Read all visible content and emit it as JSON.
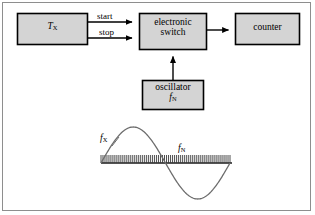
{
  "figure": {
    "type": "block-diagram",
    "caption": "",
    "background_color": "#ffffff",
    "border_color": "#8e8e8e",
    "box_fill_color": "#d4d4d4",
    "box_stroke_color": "#000000",
    "line_color": "#000000",
    "wave_color": "#6d6d6d"
  },
  "blocks": [
    {
      "id": "tx",
      "name": "tx-block",
      "label_main": "T",
      "label_sub": "X",
      "italic": true,
      "x": 17,
      "y": 13,
      "w": 71,
      "h": 32
    },
    {
      "id": "switch",
      "name": "electronic-switch-block",
      "label_line1": "electronic",
      "label_line2": "switch",
      "x": 139,
      "y": 13,
      "w": 68,
      "h": 37
    },
    {
      "id": "counter",
      "name": "counter-block",
      "label_line1": "counter",
      "x": 235,
      "y": 13,
      "w": 65,
      "h": 32
    },
    {
      "id": "oscillator",
      "name": "oscillator-block",
      "label_line1": "oscillator",
      "label_main": "f",
      "label_sub": "N",
      "x": 142,
      "y": 80,
      "w": 62,
      "h": 30
    }
  ],
  "edges": [
    {
      "id": "start",
      "name": "start-signal-edge",
      "label": "start",
      "from": "tx",
      "to": "switch",
      "y": 22
    },
    {
      "id": "stop",
      "name": "stop-signal-edge",
      "label": "stop",
      "from": "tx",
      "to": "switch",
      "y": 38
    },
    {
      "id": "gate-out",
      "name": "switch-to-counter-edge",
      "label": "",
      "from": "switch",
      "to": "counter",
      "y": 30
    },
    {
      "id": "clock",
      "name": "oscillator-to-switch-edge",
      "label": "",
      "from": "oscillator",
      "to": "switch",
      "x": 173
    }
  ],
  "waveform": {
    "name": "waveform-plot",
    "signal_label_main": "f",
    "signal_label_sub": "X",
    "pulse_label_main": "f",
    "pulse_label_sub": "N",
    "baseline_y": 163,
    "x_start": 101,
    "x_end": 230,
    "amplitude": 36,
    "cycles": 1,
    "pulse_count": 66,
    "pulse_height": 8
  },
  "chart_data": {
    "type": "line",
    "title": "",
    "xlabel": "",
    "ylabel": "",
    "series": [
      {
        "name": "f_X",
        "kind": "sine",
        "cycles": 1,
        "amplitude": 36,
        "phase": 0
      },
      {
        "name": "f_N",
        "kind": "pulse-train",
        "count": 66,
        "height": 8
      }
    ],
    "x": [
      101,
      230
    ],
    "ylim": [
      -36,
      36
    ],
    "grid": false,
    "legend": "inline-annotations"
  }
}
